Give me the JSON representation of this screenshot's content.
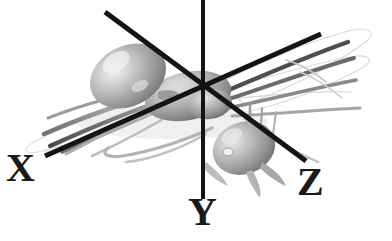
{
  "figure": {
    "kind": "3d-model-render",
    "background_color": "#ffffff",
    "width": 392,
    "height": 241,
    "shading": "grayscale-phong",
    "body_color_light": "#e2e2e2",
    "body_color_mid": "#9a9a9a",
    "body_color_dark": "#5c5c5c",
    "outline_color": "#d8d8d8"
  },
  "axes": {
    "line_color": "#141414",
    "label_color": "#1a1a1a",
    "items": [
      {
        "id": "x",
        "label": "X",
        "orientation": "diagonal-ascending",
        "start": [
          45,
          156
        ],
        "end": [
          321,
          34
        ],
        "thickness": 5
      },
      {
        "id": "y",
        "label": "Y",
        "orientation": "vertical",
        "start": [
          203,
          0
        ],
        "end": [
          203,
          199
        ],
        "thickness": 4
      },
      {
        "id": "z",
        "label": "Z",
        "orientation": "diagonal-descending",
        "start": [
          105,
          12
        ],
        "end": [
          306,
          161
        ],
        "thickness": 5
      }
    ],
    "origin": [
      203,
      90
    ]
  },
  "labels": {
    "x": "X",
    "y": "Y",
    "z": "Z"
  },
  "model_parts": [
    {
      "name": "gaster",
      "description": "abdomen ellipsoid upper-left"
    },
    {
      "name": "head",
      "description": "head capsule lower-right with compound eye"
    },
    {
      "name": "thorax",
      "description": "mesosoma center"
    },
    {
      "name": "legs",
      "description": "six jointed legs fanning left and right"
    },
    {
      "name": "antennae",
      "description": "pair of elbowed antennae toward lower-left"
    },
    {
      "name": "wing-outline",
      "description": "faint translucent wing contour upper-right"
    }
  ]
}
